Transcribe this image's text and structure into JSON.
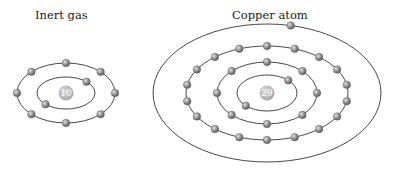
{
  "diagrams": [
    {
      "title": "Inert gas",
      "nucleus_label": "10",
      "center": [
        66,
        93
      ],
      "shells": [
        {
          "rx": 29,
          "ry": 16,
          "electrons": 2,
          "start_angle": -45
        },
        {
          "rx": 49,
          "ry": 30,
          "electrons": 8,
          "start_angle": -90
        }
      ]
    },
    {
      "title": "Copper atom",
      "nucleus_label": "29",
      "center": [
        267,
        93
      ],
      "shells": [
        {
          "rx": 30,
          "ry": 18,
          "electrons": 2,
          "start_angle": -45
        },
        {
          "rx": 50,
          "ry": 31,
          "electrons": 8,
          "start_angle": -90
        },
        {
          "rx": 81,
          "ry": 47,
          "electrons": 18,
          "start_angle": -90
        },
        {
          "rx": 114,
          "ry": 69,
          "electrons": 1,
          "start_angle": -78
        }
      ]
    }
  ],
  "colors": {
    "orbit": "#333333",
    "electron": "#8a8a8a",
    "electron_highlight": "#d0d0d0",
    "nucleus": "#bdbdbd"
  }
}
